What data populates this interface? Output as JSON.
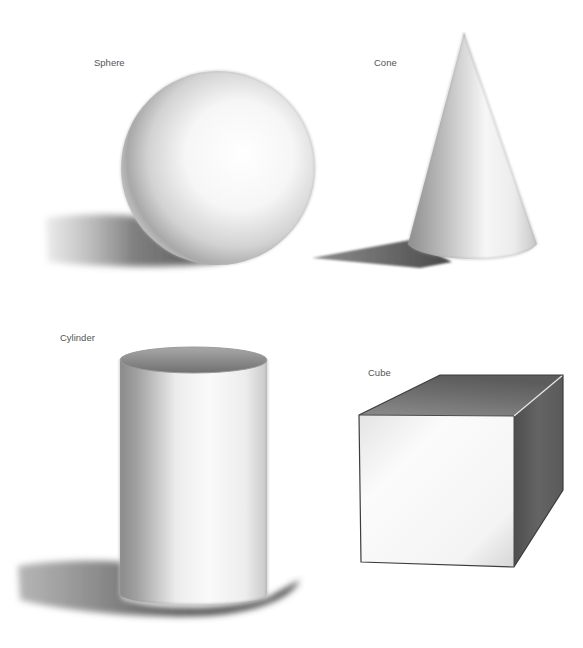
{
  "figure": {
    "background": "#ffffff",
    "shapes": [
      {
        "id": "sphere",
        "label": "Sphere",
        "label_pos": [
          94,
          57
        ]
      },
      {
        "id": "cone",
        "label": "Cone",
        "label_pos": [
          374,
          57
        ]
      },
      {
        "id": "cylinder",
        "label": "Cylinder",
        "label_pos": [
          60,
          332
        ]
      },
      {
        "id": "cube",
        "label": "Cube",
        "label_pos": [
          368,
          367
        ]
      }
    ],
    "colors": {
      "highlight": "#ffffff",
      "midtone": "#c8c8c8",
      "shadow": "#7a7a7a",
      "cast_shadow": "#5a5a5a",
      "edge": "#3c3c3c"
    }
  }
}
